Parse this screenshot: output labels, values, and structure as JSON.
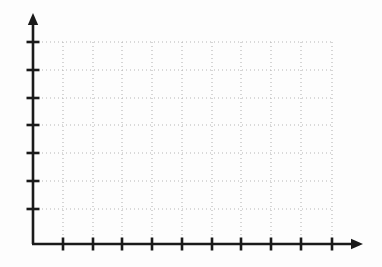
{
  "page": {
    "title": "Blank Coordinate Grid",
    "background_color": "#fdfdfd",
    "width": 382,
    "height": 267
  },
  "chart_data": {
    "type": "scatter",
    "title": "",
    "subtitle": "",
    "xlabel": "",
    "ylabel": "",
    "series": [
      {
        "name": "",
        "x": [],
        "y": []
      }
    ],
    "categories": [],
    "values": [],
    "x_tick_labels": [],
    "y_tick_labels": [],
    "legend_entries": [],
    "annotations": [],
    "grid": "on",
    "grid_style": "dotted",
    "grid_color": "#b5b5b5",
    "axis_color": "#1a1a1a",
    "legend_position": "none",
    "xlim": [
      0,
      10
    ],
    "ylim": [
      0,
      7
    ],
    "x_major_ticks": 10,
    "y_major_ticks": 7
  },
  "axes": {
    "x_axis": {
      "name": "x-axis",
      "orientation": "horizontal",
      "has_arrow": true,
      "arrow_direction": "right",
      "origin_px": {
        "x": 33,
        "y": 244
      },
      "end_px": {
        "x": 363,
        "y": 244
      },
      "stroke_width": 2.6,
      "tick_length": 13,
      "ticks_px": [
        63,
        93,
        122,
        152,
        182,
        212,
        241,
        271,
        301,
        332
      ]
    },
    "y_axis": {
      "name": "y-axis",
      "orientation": "vertical",
      "has_arrow": true,
      "arrow_direction": "up",
      "origin_px": {
        "x": 33,
        "y": 244
      },
      "end_px": {
        "x": 33,
        "y": 13
      },
      "stroke_width": 2.6,
      "tick_length": 13,
      "ticks_px": [
        42,
        70,
        98,
        125,
        153,
        181,
        209
      ]
    }
  },
  "grid": {
    "name": "dotted-grid",
    "left_px": 34,
    "right_px": 332,
    "top_px": 42,
    "bottom_px": 244,
    "horizontal_lines_px": [
      42,
      70,
      98,
      125,
      153,
      181,
      209
    ],
    "vertical_lines_px": [
      63,
      93,
      122,
      152,
      182,
      212,
      241,
      271,
      301,
      332
    ],
    "dash_pattern": "1 3",
    "stroke_width": 1.1,
    "color": "#b5b5b5"
  }
}
